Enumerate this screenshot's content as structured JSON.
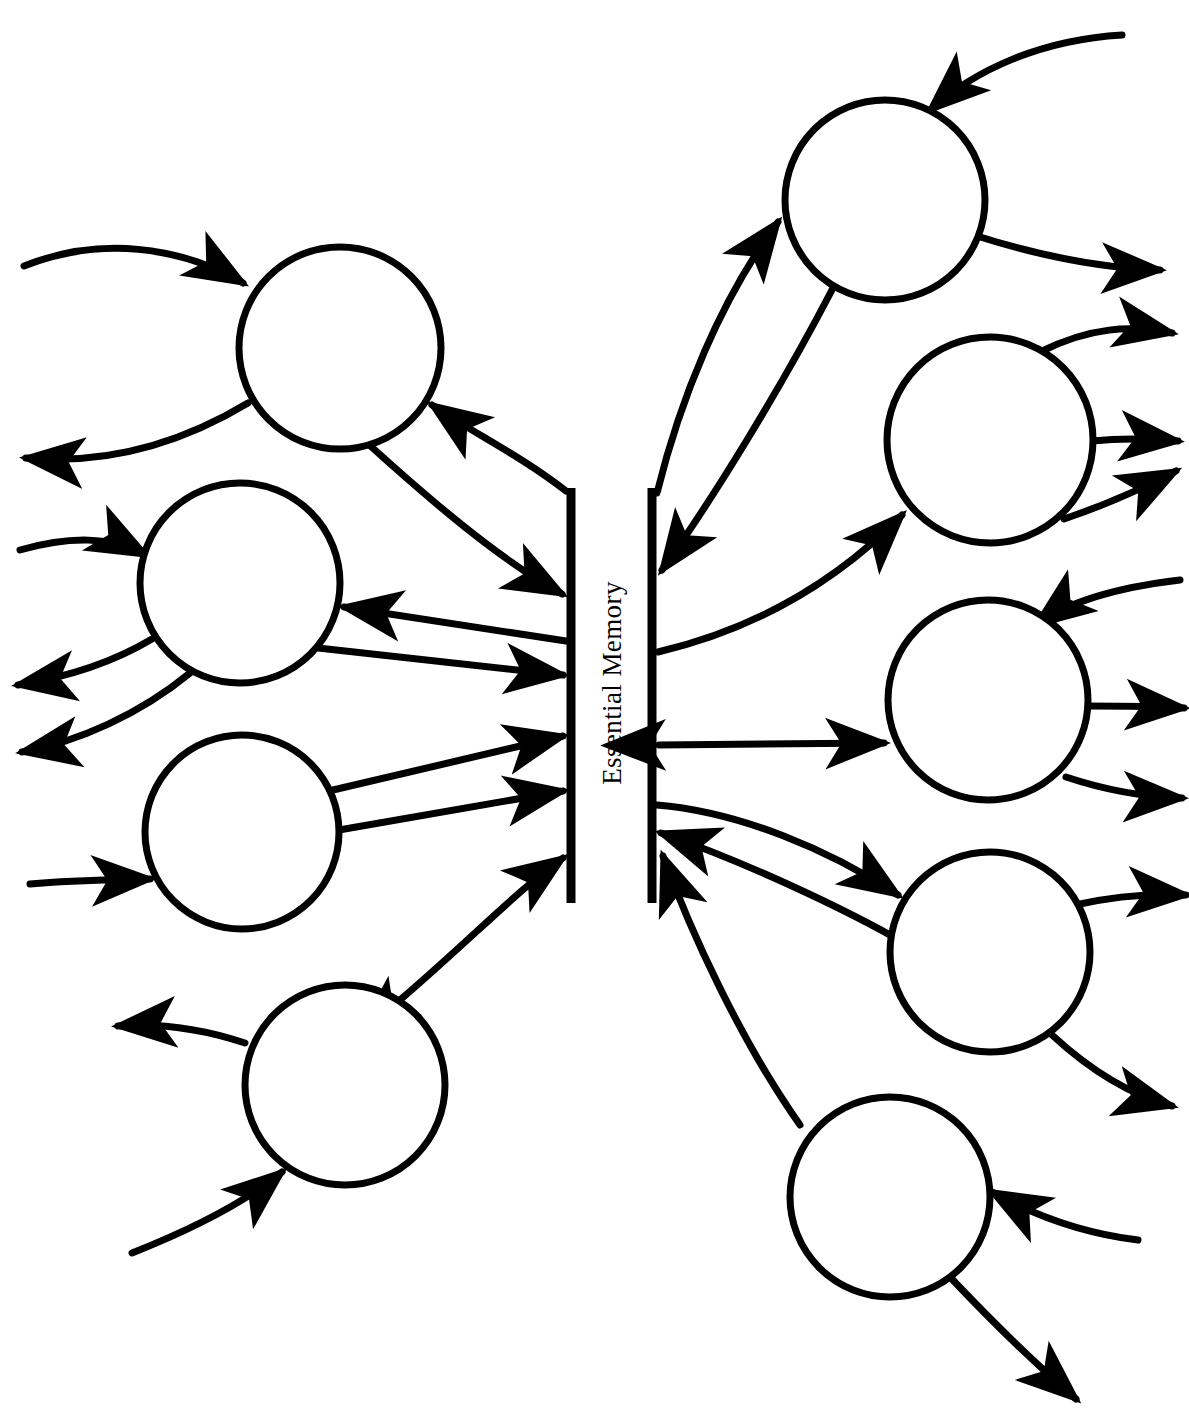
{
  "diagram": {
    "title": "Essential Memory",
    "type": "node-and-barrier schematic",
    "center_label": "Essential Memory",
    "background_color": "#ffffff",
    "stroke_color": "#000000",
    "barrier": {
      "name": "essential-memory-barrier",
      "label": "Essential Memory",
      "left_bar": {
        "x": 571,
        "y_top": 488,
        "y_bottom": 903
      },
      "right_bar": {
        "x": 652,
        "y_top": 488,
        "y_bottom": 903
      }
    },
    "nodes": [
      {
        "id": "L1",
        "side": "left",
        "cx": 340,
        "cy": 348,
        "r": 101
      },
      {
        "id": "L2",
        "side": "left",
        "cx": 240,
        "cy": 583,
        "r": 100
      },
      {
        "id": "L3",
        "side": "left",
        "cx": 242,
        "cy": 832,
        "r": 97
      },
      {
        "id": "L4",
        "side": "left",
        "cx": 345,
        "cy": 1085,
        "r": 100
      },
      {
        "id": "R1",
        "side": "right",
        "cx": 885,
        "cy": 200,
        "r": 100
      },
      {
        "id": "R2",
        "side": "right",
        "cx": 990,
        "cy": 440,
        "r": 103
      },
      {
        "id": "R3",
        "side": "right",
        "cx": 988,
        "cy": 700,
        "r": 100
      },
      {
        "id": "R4",
        "side": "right",
        "cx": 990,
        "cy": 952,
        "r": 100
      },
      {
        "id": "R5",
        "side": "right",
        "cx": 890,
        "cy": 1197,
        "r": 100
      }
    ],
    "edge_counts": {
      "total": 28,
      "to_barrier": 6,
      "from_barrier": 5,
      "bidirectional": 2,
      "external_in": 7,
      "external_out": 12
    }
  }
}
